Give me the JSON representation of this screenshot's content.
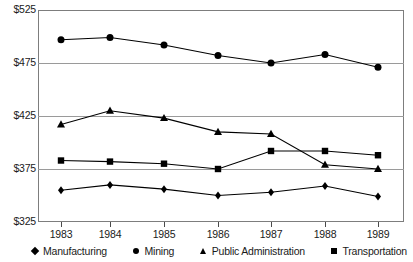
{
  "chart_data": {
    "type": "line",
    "title": "",
    "xlabel": "",
    "ylabel": "",
    "categories": [
      "1983",
      "1984",
      "1985",
      "1986",
      "1987",
      "1988",
      "1989"
    ],
    "ylim": [
      325,
      525
    ],
    "ytick_values": [
      525,
      475,
      425,
      375,
      325
    ],
    "ytick_labels": [
      "$525",
      "$475",
      "$425",
      "$375",
      "$325"
    ],
    "grid": true,
    "legend_position": "bottom",
    "series": [
      {
        "name": "Manufacturing",
        "marker": "diamond",
        "values": [
          355,
          360,
          356,
          350,
          353,
          359,
          349
        ]
      },
      {
        "name": "Mining",
        "marker": "circle",
        "values": [
          497,
          499,
          492,
          482,
          475,
          483,
          471
        ]
      },
      {
        "name": "Public Administration",
        "marker": "triangle",
        "values": [
          417,
          430,
          423,
          410,
          408,
          379,
          375
        ]
      },
      {
        "name": "Transportation",
        "marker": "square",
        "values": [
          383,
          382,
          380,
          375,
          392,
          392,
          388
        ]
      }
    ]
  },
  "axis": {
    "y_labels": [
      "$525",
      "$475",
      "$425",
      "$375",
      "$325"
    ],
    "x_labels": [
      "1983",
      "1984",
      "1985",
      "1986",
      "1987",
      "1988",
      "1989"
    ]
  },
  "legend": {
    "items": [
      {
        "label": "Manufacturing",
        "marker": "diamond-marker"
      },
      {
        "label": "Mining",
        "marker": "circle-marker"
      },
      {
        "label": "Public Administration",
        "marker": "triangle-marker"
      },
      {
        "label": "Transportation",
        "marker": "square-marker"
      }
    ]
  },
  "colors": {
    "series": "#000000",
    "gridline": "#9a9a9a",
    "frame": "#7d7d7d",
    "text": "#1a1a1a",
    "background": "#ffffff"
  }
}
